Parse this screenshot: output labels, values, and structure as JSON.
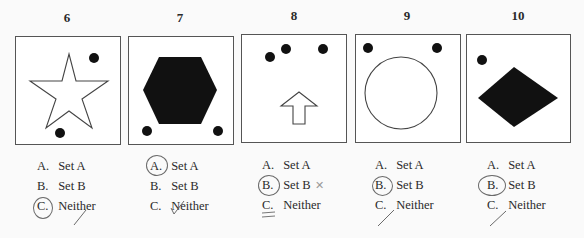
{
  "problems": [
    {
      "number": "6",
      "figure": "star-outline-with-two-dots",
      "options": [
        {
          "letter": "A.",
          "text": "Set A"
        },
        {
          "letter": "B.",
          "text": "Set B"
        },
        {
          "letter": "C.",
          "text": "Neither"
        }
      ],
      "circled": "C",
      "mark": "check"
    },
    {
      "number": "7",
      "figure": "filled-hexagon-with-two-dots",
      "options": [
        {
          "letter": "A.",
          "text": "Set A"
        },
        {
          "letter": "B.",
          "text": "Set B"
        },
        {
          "letter": "C.",
          "text": "Neither"
        }
      ],
      "circled": "A",
      "mark": "check"
    },
    {
      "number": "8",
      "figure": "arrow-outline-with-three-dots",
      "options": [
        {
          "letter": "A.",
          "text": "Set A"
        },
        {
          "letter": "B.",
          "text": "Set B"
        },
        {
          "letter": "C.",
          "text": "Neither"
        }
      ],
      "circled": "B",
      "mark": "x",
      "underlined": "C"
    },
    {
      "number": "9",
      "figure": "circle-outline-with-two-dots",
      "options": [
        {
          "letter": "A.",
          "text": "Set A"
        },
        {
          "letter": "B.",
          "text": "Set B"
        },
        {
          "letter": "C.",
          "text": "Neither"
        }
      ],
      "circled": "B",
      "mark": "check"
    },
    {
      "number": "10",
      "figure": "filled-diamond-with-one-dot",
      "options": [
        {
          "letter": "A.",
          "text": "Set A"
        },
        {
          "letter": "B.",
          "text": "Set B"
        },
        {
          "letter": "C.",
          "text": "Neither"
        }
      ],
      "circled": "B",
      "mark": "check"
    }
  ],
  "colors": {
    "ink": "#2a2a2a",
    "pencil": "#6a6a6a",
    "fill": "#111111"
  }
}
